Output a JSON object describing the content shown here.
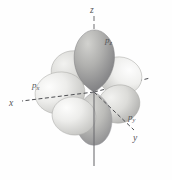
{
  "figure": {
    "name": "p-orbital-set-diagram",
    "background_color": "#fefefe"
  },
  "axes": {
    "x": {
      "label": "x",
      "style": "dashed",
      "color": "#4d4e52"
    },
    "y": {
      "label": "y",
      "style": "dashed",
      "color": "#4d4e52"
    },
    "z": {
      "label": "z",
      "style": "solid-dashed",
      "color": "#6d6e72"
    }
  },
  "orbitals": [
    {
      "id": "px",
      "label": "p",
      "subscript": "x",
      "color_light": "#e8e8e6",
      "color_dark": "#b9b9b6"
    },
    {
      "id": "py",
      "label": "p",
      "subscript": "y",
      "color_light": "#eaeae8",
      "color_dark": "#bdbdba"
    },
    {
      "id": "pz",
      "label": "p",
      "subscript": "z",
      "color_light": "#c9c9c6",
      "color_dark": "#86868a"
    }
  ],
  "colors": {
    "label_text": "#55565a",
    "axis_line": "#4d4e52",
    "lobe_outline": "#9a9a98"
  }
}
